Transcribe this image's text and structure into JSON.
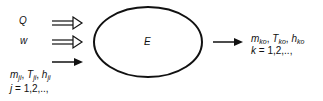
{
  "diagram": {
    "system_label": "E",
    "inputs": [
      {
        "symbol": "Q",
        "arrow": "double"
      },
      {
        "symbol": "w",
        "arrow": "double"
      },
      {
        "symbol": "m_ji, T_ji, h_ji",
        "arrow": "single"
      }
    ],
    "input_stream": {
      "m": "m",
      "m_sub": "ji",
      "T": "T",
      "T_sub": "ji",
      "h": "h",
      "h_sub": "ji",
      "index_var": "j",
      "index_range": " = 1,2,..,"
    },
    "output_stream": {
      "m": "m",
      "m_sub": "ko",
      "T": "T",
      "T_sub": "ko",
      "h": "h",
      "h_sub": "ko",
      "index_var": "k",
      "index_range": " = 1,2,..,"
    },
    "sep": ", "
  }
}
